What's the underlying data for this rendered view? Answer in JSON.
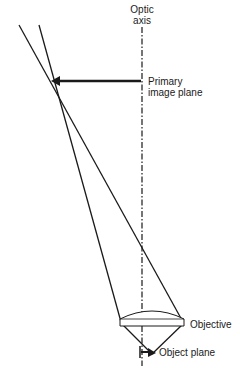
{
  "diagram": {
    "labels": {
      "optic_axis_line1": "Optic",
      "optic_axis_line2": "axis",
      "primary_image_plane_line1": "Primary",
      "primary_image_plane_line2": "image plane",
      "objective": "Objective",
      "object_plane": "Object plane"
    },
    "colors": {
      "stroke": "#1a1a1a",
      "background": "#ffffff"
    }
  }
}
